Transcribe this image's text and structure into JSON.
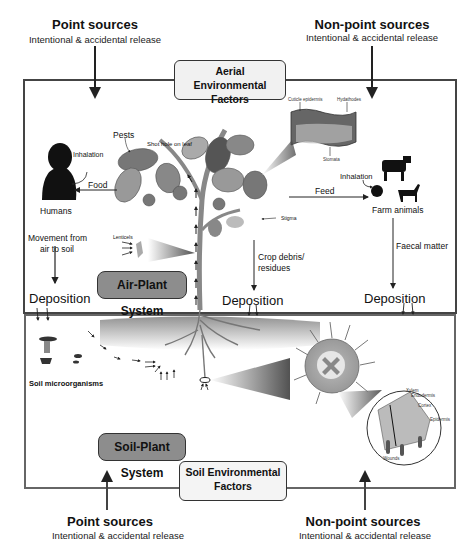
{
  "top_sources": {
    "point": {
      "title": "Point sources",
      "subtitle": "Intentional & accidental release"
    },
    "non_point": {
      "title": "Non-point sources",
      "subtitle": "Intentional & accidental release"
    }
  },
  "bottom_sources": {
    "point": {
      "title": "Point sources",
      "subtitle": "Intentional & accidental release"
    },
    "non_point": {
      "title": "Non-point sources",
      "subtitle": "Intentional & accidental release"
    }
  },
  "aerial_factors": {
    "line1": "Aerial Environmental",
    "line2": "Factors"
  },
  "soil_factors": {
    "line1": "Soil Environmental",
    "line2": "Factors"
  },
  "air_plant_system": "Air-Plant System",
  "soil_plant_system": "Soil-Plant System",
  "labels": {
    "pests": "Pests",
    "shot_hole": "Shot hole on leaf",
    "inhalation_human": "Inhalation",
    "food": "Food",
    "humans": "Humans",
    "movement_line1": "Movement from",
    "movement_line2": "air to soil",
    "lenticels": "Lenticels",
    "stigma": "Stigma",
    "feed": "Feed",
    "inhalation_animal": "Inhalation",
    "farm_animals": "Farm animals",
    "crop_debris_line1": "Crop debris/",
    "crop_debris_line2": "residues",
    "faecal_matter": "Faecal matter",
    "deposition_left": "Deposition",
    "deposition_center": "Deposition",
    "deposition_right": "Deposition",
    "soil_microorganisms": "Soil microorganisms",
    "cuticle_epidermis": "Cuticle epidermis",
    "hydathodes": "Hydathodes",
    "stomata": "Stomata",
    "xylem": "Xylem",
    "endodermis": "Endodermis",
    "cortex": "Cortex",
    "epidermis": "Epidermis",
    "wounds": "Wounds"
  },
  "colors": {
    "border": "#444444",
    "system_fill": "#8d8d8d",
    "factor_fill": "#f1f1f1"
  }
}
